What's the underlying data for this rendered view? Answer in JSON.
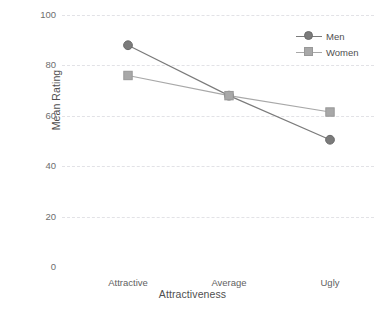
{
  "chart_data": {
    "type": "line",
    "title": "",
    "subtitle": "",
    "xlabel": "Attractiveness",
    "ylabel": "Mean Rating",
    "categories": [
      "Attractive",
      "Average",
      "Ugly"
    ],
    "series": [
      {
        "name": "Men",
        "values": [
          88,
          68,
          50.5
        ],
        "color": "#7b7b7b",
        "marker": "circle"
      },
      {
        "name": "Women",
        "values": [
          76,
          68,
          61.5
        ],
        "color": "#a8a8a8",
        "marker": "square"
      }
    ],
    "ylim": [
      0,
      100
    ],
    "yticks": [
      0,
      20,
      40,
      60,
      80,
      100
    ],
    "ytick_labels": [
      "0",
      "20",
      "40",
      "60",
      "80",
      "100"
    ],
    "grid": true,
    "grid_axis": "y",
    "grid_style": "dashed",
    "grid_color": "#e2e2e6",
    "legend_position": "top-right",
    "legend_entries": [
      "Men",
      "Women"
    ],
    "background": "#ffffff"
  },
  "axis": {
    "y_title": "Mean Rating",
    "x_title": "Attractiveness"
  }
}
